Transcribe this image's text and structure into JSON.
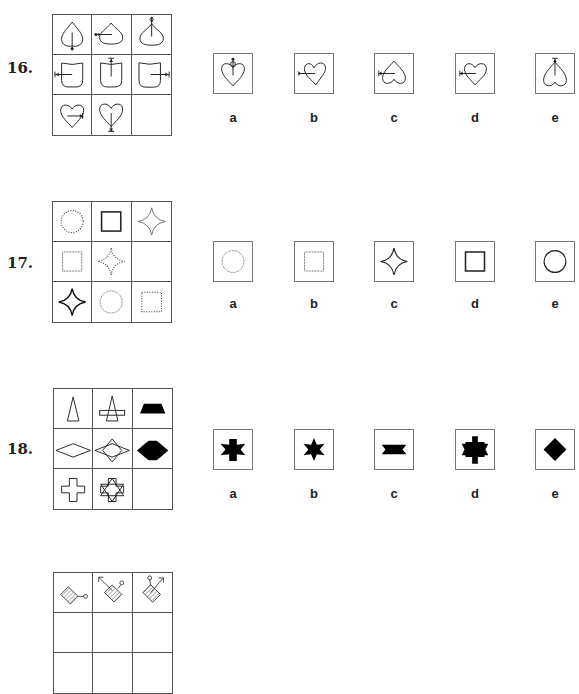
{
  "questions": [
    {
      "number": "16.",
      "grid": [
        [
          "spade-arrow-down",
          "spade-arrow-left",
          "spade-arrow-up"
        ],
        [
          "shield-arrow-left",
          "shield-arrow-up",
          "shield-arrow-right"
        ],
        [
          "heart-arrow-right",
          "heart-arrow-down",
          "empty"
        ]
      ],
      "options": [
        {
          "label": "a",
          "shape": "heart-arrow-up-circle"
        },
        {
          "label": "b",
          "shape": "heart-arrow-left-tilted"
        },
        {
          "label": "c",
          "shape": "inverted-heart-arrow-left"
        },
        {
          "label": "d",
          "shape": "heart-arrow-left"
        },
        {
          "label": "e",
          "shape": "inverted-heart-arrow-up"
        }
      ]
    },
    {
      "number": "17.",
      "grid": [
        [
          "circle-dotted",
          "square-solid-thick",
          "star4-thin"
        ],
        [
          "square-fine-dotted",
          "star4-dotted",
          "empty"
        ],
        [
          "star4-thick",
          "circle-fine-dotted",
          "square-dotted"
        ]
      ],
      "options": [
        {
          "label": "a",
          "shape": "circle-fine-dotted"
        },
        {
          "label": "b",
          "shape": "square-fine-dotted"
        },
        {
          "label": "c",
          "shape": "star4-solid"
        },
        {
          "label": "d",
          "shape": "square-solid-thick"
        },
        {
          "label": "e",
          "shape": "circle-solid"
        }
      ]
    },
    {
      "number": "18.",
      "grid": [
        [
          "triangle-outline",
          "triangle-over-rectangle",
          "trapezoid-filled"
        ],
        [
          "rhombus-outline",
          "rhombus-over-rhombus",
          "lens-filled"
        ],
        [
          "cross-outline",
          "cross-over-star6",
          "empty"
        ]
      ],
      "options": [
        {
          "label": "a",
          "shape": "cross-star-filled"
        },
        {
          "label": "b",
          "shape": "star6-filled"
        },
        {
          "label": "c",
          "shape": "bowtie-filled"
        },
        {
          "label": "d",
          "shape": "cross-star-tall-filled"
        },
        {
          "label": "e",
          "shape": "diamond-filled"
        }
      ]
    },
    {
      "number": "19.",
      "grid_partial": [
        "hatched-square-knob-right",
        "hatched-square-arrow-up-left",
        "hatched-square-arrow-up-right"
      ]
    }
  ]
}
